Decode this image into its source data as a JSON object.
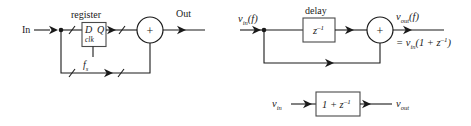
{
  "figure": {
    "panels": [
      {
        "id": "hardware-implementation",
        "name": "register-adder-hardware-diagram",
        "input_label": "In",
        "output_label": "Out",
        "block_caption": "register",
        "block_pin_d": "D",
        "block_pin_q": "Q",
        "block_pin_clk": "clk",
        "clock_label_base": "f",
        "clock_label_sub": "s",
        "adder_symbol": "+",
        "bus_slash_count": 4
      },
      {
        "id": "z-domain-feedforward",
        "name": "z-domain-delay-adder-diagram",
        "input_label_base": "v",
        "input_label_sub": "in",
        "input_label_arg": "(f)",
        "block_caption": "delay",
        "block_expr_base": "z",
        "block_expr_sup": "–1",
        "adder_symbol": "+",
        "output_label_base": "v",
        "output_label_sub": "out",
        "output_label_arg": "(f)",
        "output_equation_prefix": "= v",
        "output_equation_sub": "in",
        "output_equation_body": "(1 + z",
        "output_equation_sup": "–1",
        "output_equation_close": ")"
      },
      {
        "id": "transfer-function-block",
        "name": "transfer-function-block-diagram",
        "input_label_base": "v",
        "input_label_sub": "in",
        "block_expr_prefix": "1 + z",
        "block_expr_sup": "–1",
        "output_label_base": "v",
        "output_label_sub": "out"
      }
    ],
    "colors": {
      "ink": "#1a1a1a",
      "box_stroke": "#4a4a4a",
      "background": "#ffffff"
    }
  }
}
